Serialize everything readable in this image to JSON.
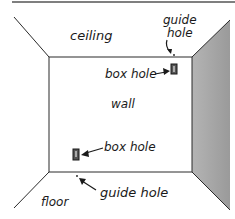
{
  "diagram": {
    "labels": {
      "ceiling": "ceiling",
      "wall": "wall",
      "floor": "floor",
      "guide_hole_top_line1": "guide",
      "guide_hole_top_line2": "hole",
      "box_hole_top": "box hole",
      "box_hole_bottom": "box hole",
      "guide_hole_bottom": "guide hole"
    },
    "colors": {
      "line": "#2a2a2a",
      "side_wall": "#a8a8a8",
      "background": "#ffffff"
    }
  }
}
